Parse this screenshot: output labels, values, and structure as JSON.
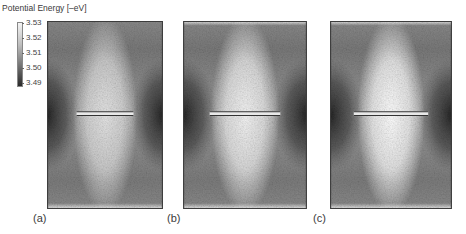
{
  "colorbar": {
    "title": "Potential Energy [–eV]",
    "ticks": [
      "3.53",
      "3.52",
      "3.51",
      "3.50",
      "3.49"
    ],
    "min": 3.49,
    "max": 3.53,
    "colormap": "grayscale (light = high, dark = low)"
  },
  "panels": [
    {
      "label": "(a)",
      "bar_extent_fraction": 0.49,
      "bright_core": "moderate"
    },
    {
      "label": "(b)",
      "bar_extent_fraction": 0.57,
      "bright_core": "strong"
    },
    {
      "label": "(c)",
      "bar_extent_fraction": 0.61,
      "bright_core": "strongest"
    }
  ]
}
